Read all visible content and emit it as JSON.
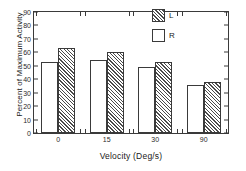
{
  "chart_data": {
    "type": "bar",
    "title": "",
    "xlabel": "Velocity (Deg/s)",
    "ylabel": "Percent of Maximum Activity",
    "categories": [
      "0",
      "15",
      "30",
      "90"
    ],
    "series": [
      {
        "name": "R",
        "fill": "white",
        "values": [
          53,
          54,
          49,
          36
        ]
      },
      {
        "name": "L",
        "fill": "hatched",
        "values": [
          63.5,
          60,
          53,
          38
        ]
      }
    ],
    "series_order_in_group": [
      "R",
      "L"
    ],
    "ylim": [
      0,
      90
    ],
    "yticks": [
      0,
      10,
      20,
      30,
      40,
      50,
      60,
      70,
      80,
      90
    ],
    "ytick_labels": [
      "0",
      "10",
      "20",
      "30",
      "40",
      "50",
      "60",
      "70",
      "80",
      "90"
    ],
    "grid": false,
    "legend_position": "top-right",
    "legend": [
      {
        "label": "L",
        "fill": "hatched"
      },
      {
        "label": "R",
        "fill": "white"
      }
    ],
    "frame": "box",
    "colors": {
      "axis": "#3a3a3a",
      "hatch": "#4a4a4a",
      "bar_face": "#ffffff",
      "text": "#1a1a1a",
      "background": "#ffffff"
    }
  }
}
